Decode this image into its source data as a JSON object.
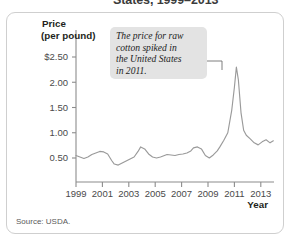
{
  "figure": {
    "title_partial": "States, 1999–2013",
    "source": "Source: USDA."
  },
  "callout": {
    "lines": [
      "The price for raw",
      "cotton spiked in",
      "the United States",
      "in 2011."
    ],
    "bg_color": "#e3e3e3",
    "leader_color": "#6f6f6f"
  },
  "axes": {
    "y_title_line1": "Price",
    "y_title_line2": "(per pound)",
    "x_title": "Year",
    "y_ticks": [
      "$2.50",
      "2.00",
      "1.50",
      "1.00",
      "0.50"
    ],
    "y_tick_values": [
      2.5,
      2.0,
      1.5,
      1.0,
      0.5
    ],
    "x_ticks": [
      "1999",
      "2001",
      "2003",
      "2005",
      "2007",
      "2009",
      "2011",
      "2013"
    ],
    "x_tick_values": [
      1999,
      2001,
      2003,
      2005,
      2007,
      2009,
      2011,
      2013
    ],
    "axis_color": "#8c8c8c"
  },
  "chart_data": {
    "type": "line",
    "title": "States, 1999–2013",
    "xlabel": "Year",
    "ylabel": "Price (per pound)",
    "xlim": [
      1999,
      2014
    ],
    "ylim": [
      0,
      2.75
    ],
    "grid": false,
    "legend": null,
    "line_color": "#9a9a9a",
    "annotations": [
      {
        "text": "The price for raw cotton spiked in the United States in 2011.",
        "points_to_x": 2011.2,
        "points_to_y": 2.3
      }
    ],
    "series": [
      {
        "name": "Raw cotton price (US$ per pound)",
        "x": [
          1999.0,
          1999.3,
          1999.6,
          1999.9,
          2000.2,
          2000.5,
          2000.8,
          2001.1,
          2001.4,
          2001.7,
          2001.9,
          2002.2,
          2002.5,
          2002.8,
          2003.1,
          2003.4,
          2003.7,
          2003.9,
          2004.2,
          2004.5,
          2004.8,
          2005.1,
          2005.4,
          2005.7,
          2005.9,
          2006.2,
          2006.5,
          2006.8,
          2007.1,
          2007.4,
          2007.7,
          2007.9,
          2008.2,
          2008.5,
          2008.8,
          2009.1,
          2009.4,
          2009.7,
          2009.9,
          2010.2,
          2010.5,
          2010.8,
          2011.0,
          2011.15,
          2011.3,
          2011.5,
          2011.7,
          2011.9,
          2012.2,
          2012.5,
          2012.8,
          2013.1,
          2013.4,
          2013.7,
          2013.95
        ],
        "y": [
          0.55,
          0.52,
          0.49,
          0.52,
          0.57,
          0.6,
          0.63,
          0.62,
          0.58,
          0.45,
          0.38,
          0.36,
          0.4,
          0.44,
          0.48,
          0.52,
          0.63,
          0.72,
          0.68,
          0.58,
          0.52,
          0.5,
          0.52,
          0.55,
          0.57,
          0.56,
          0.55,
          0.57,
          0.58,
          0.6,
          0.64,
          0.7,
          0.72,
          0.68,
          0.55,
          0.5,
          0.56,
          0.64,
          0.72,
          0.85,
          1.0,
          1.45,
          1.9,
          2.3,
          2.05,
          1.4,
          1.05,
          0.95,
          0.88,
          0.8,
          0.76,
          0.82,
          0.86,
          0.8,
          0.84
        ]
      }
    ]
  }
}
